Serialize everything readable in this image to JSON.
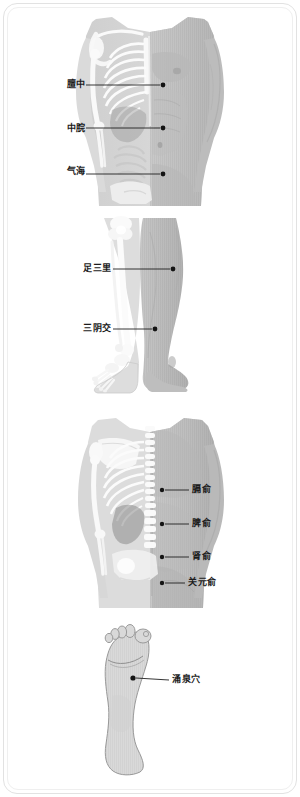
{
  "document": {
    "type": "acupuncture-point-reference-chart",
    "panel_count": 4
  },
  "colors": {
    "frame_border": "#e2e2e2",
    "label_text": "#1b1b1b",
    "leader_line": "#1f1f1f",
    "point_dot": "#141414",
    "skin_light": "#d7d7d7",
    "skin_mid": "#c3c3c3",
    "skin_dark": "#a9a9a9",
    "bone_light": "#fbfbfb",
    "bone_shadow": "#d2d2d2",
    "organ_gray": "#8f8f8f",
    "background": "#ffffff"
  },
  "panels": [
    {
      "id": "front-torso",
      "name": "front-torso-panel",
      "view": "anterior trunk, skeleton overlay on left half, skin on right half",
      "points": [
        {
          "id": "tanzhong",
          "label": "膻中",
          "label_x": 52,
          "label_y": 80,
          "dot_x": 163,
          "dot_y": 85,
          "line_x1": 86,
          "line_x2": 160
        },
        {
          "id": "zhongwan",
          "label": "中脘",
          "label_x": 52,
          "label_y": 124,
          "dot_x": 163,
          "dot_y": 128,
          "line_x1": 86,
          "line_x2": 160
        },
        {
          "id": "qihai",
          "label": "气海",
          "label_x": 52,
          "label_y": 167,
          "dot_x": 163,
          "dot_y": 174,
          "line_x1": 86,
          "line_x2": 160
        }
      ]
    },
    {
      "id": "legs",
      "name": "lower-legs-panel",
      "view": "anterior lower legs, skeleton overlay on left leg, skin on right leg",
      "points": [
        {
          "id": "zusanli",
          "label": "足三里",
          "label_x": 74,
          "label_y": 269,
          "dot_x": 173,
          "dot_y": 269,
          "line_x1": 113,
          "line_x2": 170
        },
        {
          "id": "sanyinjiao",
          "label": "三阴交",
          "label_x": 74,
          "label_y": 329,
          "dot_x": 155,
          "dot_y": 329,
          "line_x1": 113,
          "line_x2": 152
        }
      ]
    },
    {
      "id": "back-torso",
      "name": "back-torso-panel",
      "view": "posterior trunk, skeleton overlay on left half, skin on right half",
      "points": [
        {
          "id": "geshu",
          "label": "膈俞",
          "label_x": 193,
          "label_y": 490,
          "dot_x": 162,
          "dot_y": 490,
          "line_x1": 165,
          "line_x2": 189
        },
        {
          "id": "pishu",
          "label": "脾俞",
          "label_x": 193,
          "label_y": 524,
          "dot_x": 162,
          "dot_y": 524,
          "line_x1": 165,
          "line_x2": 189
        },
        {
          "id": "shenshu",
          "label": "肾俞",
          "label_x": 193,
          "label_y": 557,
          "dot_x": 162,
          "dot_y": 557,
          "line_x1": 165,
          "line_x2": 189
        },
        {
          "id": "guanyuanshu",
          "label": "关元俞",
          "label_x": 189,
          "label_y": 583,
          "dot_x": 162,
          "dot_y": 583,
          "line_x1": 165,
          "line_x2": 185
        }
      ]
    },
    {
      "id": "foot-sole",
      "name": "foot-sole-panel",
      "view": "plantar surface of right foot, outline drawing",
      "points": [
        {
          "id": "yongquanxue",
          "label": "涌泉穴",
          "label_x": 172,
          "label_y": 682,
          "dot_x": 133,
          "dot_y": 678,
          "line_x1": 136,
          "line_x2": 169
        }
      ]
    }
  ]
}
